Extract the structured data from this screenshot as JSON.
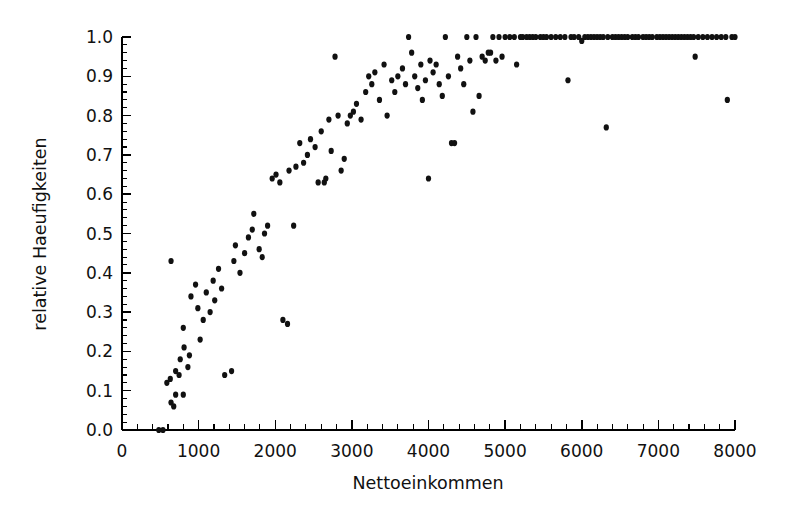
{
  "chart_data": {
    "type": "scatter",
    "title": "",
    "xlabel": "Nettoeinkommen",
    "ylabel": "relative Haeufigkeiten",
    "xlim": [
      0,
      8000
    ],
    "ylim": [
      0.0,
      1.0
    ],
    "grid": false,
    "legend": null,
    "xticks": [
      0,
      1000,
      2000,
      3000,
      4000,
      5000,
      6000,
      7000,
      8000
    ],
    "xtick_labels": [
      "0",
      "1000",
      "2000",
      "3000",
      "4000",
      "5000",
      "6000",
      "7000",
      "8000"
    ],
    "x_minor_per_major": 5,
    "yticks": [
      0.0,
      0.1,
      0.2,
      0.3,
      0.4,
      0.5,
      0.6,
      0.7,
      0.8,
      0.9,
      1.0
    ],
    "ytick_labels": [
      "0.0",
      "0.1",
      "0.2",
      "0.3",
      "0.4",
      "0.5",
      "0.6",
      "0.7",
      "0.8",
      "0.9",
      "1.0"
    ],
    "y_minor_per_major": 5,
    "marker": "filled-circle",
    "marker_color": "#111111",
    "marker_size_px": 3.1,
    "points": [
      [
        480,
        0.0
      ],
      [
        535,
        0.0
      ],
      [
        640,
        0.07
      ],
      [
        675,
        0.06
      ],
      [
        700,
        0.09
      ],
      [
        585,
        0.12
      ],
      [
        630,
        0.13
      ],
      [
        800,
        0.09
      ],
      [
        700,
        0.15
      ],
      [
        745,
        0.14
      ],
      [
        760,
        0.18
      ],
      [
        810,
        0.21
      ],
      [
        640,
        0.43
      ],
      [
        800,
        0.26
      ],
      [
        860,
        0.16
      ],
      [
        880,
        0.19
      ],
      [
        900,
        0.34
      ],
      [
        960,
        0.37
      ],
      [
        990,
        0.31
      ],
      [
        1020,
        0.23
      ],
      [
        1060,
        0.28
      ],
      [
        1100,
        0.35
      ],
      [
        1150,
        0.3
      ],
      [
        1190,
        0.38
      ],
      [
        1210,
        0.33
      ],
      [
        1260,
        0.41
      ],
      [
        1300,
        0.36
      ],
      [
        1340,
        0.14
      ],
      [
        1430,
        0.15
      ],
      [
        1460,
        0.43
      ],
      [
        1480,
        0.47
      ],
      [
        1540,
        0.4
      ],
      [
        1600,
        0.45
      ],
      [
        1650,
        0.49
      ],
      [
        1700,
        0.51
      ],
      [
        1720,
        0.55
      ],
      [
        1790,
        0.46
      ],
      [
        1830,
        0.44
      ],
      [
        1860,
        0.5
      ],
      [
        1900,
        0.52
      ],
      [
        1960,
        0.64
      ],
      [
        2010,
        0.65
      ],
      [
        2060,
        0.63
      ],
      [
        2100,
        0.28
      ],
      [
        2160,
        0.27
      ],
      [
        2180,
        0.66
      ],
      [
        2240,
        0.52
      ],
      [
        2270,
        0.67
      ],
      [
        2320,
        0.73
      ],
      [
        2370,
        0.68
      ],
      [
        2420,
        0.7
      ],
      [
        2460,
        0.74
      ],
      [
        2520,
        0.72
      ],
      [
        2560,
        0.63
      ],
      [
        2600,
        0.76
      ],
      [
        2640,
        0.63
      ],
      [
        2660,
        0.64
      ],
      [
        2700,
        0.79
      ],
      [
        2730,
        0.71
      ],
      [
        2780,
        0.95
      ],
      [
        2820,
        0.8
      ],
      [
        2860,
        0.66
      ],
      [
        2900,
        0.69
      ],
      [
        2940,
        0.78
      ],
      [
        2980,
        0.8
      ],
      [
        3020,
        0.81
      ],
      [
        3060,
        0.83
      ],
      [
        3120,
        0.79
      ],
      [
        3180,
        0.86
      ],
      [
        3220,
        0.9
      ],
      [
        3260,
        0.88
      ],
      [
        3300,
        0.91
      ],
      [
        3360,
        0.84
      ],
      [
        3420,
        0.93
      ],
      [
        3460,
        0.8
      ],
      [
        3520,
        0.89
      ],
      [
        3560,
        0.86
      ],
      [
        3600,
        0.9
      ],
      [
        3660,
        0.92
      ],
      [
        3700,
        0.88
      ],
      [
        3740,
        1.0
      ],
      [
        3780,
        0.96
      ],
      [
        3820,
        0.9
      ],
      [
        3860,
        0.87
      ],
      [
        3900,
        0.93
      ],
      [
        3920,
        0.84
      ],
      [
        3960,
        0.89
      ],
      [
        4000,
        0.64
      ],
      [
        4020,
        0.94
      ],
      [
        4060,
        0.91
      ],
      [
        4100,
        0.93
      ],
      [
        4140,
        0.88
      ],
      [
        4180,
        0.85
      ],
      [
        4220,
        1.0
      ],
      [
        4260,
        0.9
      ],
      [
        4300,
        0.73
      ],
      [
        4340,
        0.73
      ],
      [
        4380,
        0.95
      ],
      [
        4420,
        0.92
      ],
      [
        4460,
        0.88
      ],
      [
        4500,
        1.0
      ],
      [
        4540,
        0.94
      ],
      [
        4580,
        0.81
      ],
      [
        4620,
        1.0
      ],
      [
        4660,
        0.85
      ],
      [
        4700,
        0.95
      ],
      [
        4740,
        0.94
      ],
      [
        4780,
        0.96
      ],
      [
        4810,
        0.96
      ],
      [
        4840,
        1.0
      ],
      [
        4880,
        0.94
      ],
      [
        4920,
        1.0
      ],
      [
        4960,
        0.95
      ],
      [
        5000,
        1.0
      ],
      [
        5060,
        1.0
      ],
      [
        5120,
        1.0
      ],
      [
        5150,
        0.93
      ],
      [
        5200,
        1.0
      ],
      [
        5230,
        1.0
      ],
      [
        5280,
        1.0
      ],
      [
        5320,
        1.0
      ],
      [
        5360,
        1.0
      ],
      [
        5400,
        1.0
      ],
      [
        5460,
        1.0
      ],
      [
        5500,
        1.0
      ],
      [
        5540,
        1.0
      ],
      [
        5600,
        1.0
      ],
      [
        5660,
        1.0
      ],
      [
        5720,
        1.0
      ],
      [
        5780,
        1.0
      ],
      [
        5820,
        0.89
      ],
      [
        5860,
        1.0
      ],
      [
        5900,
        1.0
      ],
      [
        5960,
        1.0
      ],
      [
        6000,
        0.99
      ],
      [
        6040,
        1.0
      ],
      [
        6080,
        1.0
      ],
      [
        6120,
        1.0
      ],
      [
        6160,
        1.0
      ],
      [
        6200,
        1.0
      ],
      [
        6240,
        1.0
      ],
      [
        6280,
        1.0
      ],
      [
        6320,
        0.77
      ],
      [
        6340,
        1.0
      ],
      [
        6400,
        1.0
      ],
      [
        6440,
        1.0
      ],
      [
        6480,
        1.0
      ],
      [
        6520,
        1.0
      ],
      [
        6560,
        1.0
      ],
      [
        6600,
        1.0
      ],
      [
        6660,
        1.0
      ],
      [
        6700,
        1.0
      ],
      [
        6740,
        1.0
      ],
      [
        6800,
        1.0
      ],
      [
        6840,
        1.0
      ],
      [
        6880,
        1.0
      ],
      [
        6920,
        1.0
      ],
      [
        6980,
        1.0
      ],
      [
        7020,
        1.0
      ],
      [
        7060,
        1.0
      ],
      [
        7100,
        1.0
      ],
      [
        7140,
        1.0
      ],
      [
        7180,
        1.0
      ],
      [
        7220,
        1.0
      ],
      [
        7260,
        1.0
      ],
      [
        7300,
        1.0
      ],
      [
        7340,
        1.0
      ],
      [
        7380,
        1.0
      ],
      [
        7420,
        1.0
      ],
      [
        7460,
        1.0
      ],
      [
        7480,
        0.95
      ],
      [
        7520,
        1.0
      ],
      [
        7580,
        1.0
      ],
      [
        7640,
        1.0
      ],
      [
        7700,
        1.0
      ],
      [
        7760,
        1.0
      ],
      [
        7820,
        1.0
      ],
      [
        7880,
        1.0
      ],
      [
        7900,
        0.84
      ],
      [
        7960,
        1.0
      ],
      [
        8000,
        1.0
      ]
    ]
  }
}
